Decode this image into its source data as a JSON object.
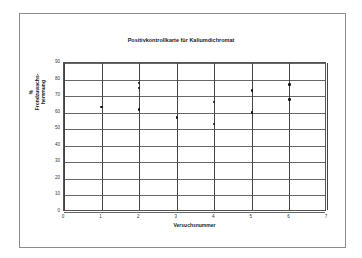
{
  "chart_data": {
    "type": "scatter",
    "title": "Positivkontrollkarte für Kaliumdichromat",
    "xlabel": "Versuchsnummer",
    "ylabel": "% Frondzuwachs-hemmung",
    "xlim": [
      0,
      7
    ],
    "ylim": [
      0,
      90
    ],
    "x_ticks": [
      0,
      1,
      2,
      3,
      4,
      5,
      6,
      7
    ],
    "y_ticks": [
      0,
      10,
      20,
      30,
      40,
      50,
      60,
      70,
      80,
      90
    ],
    "grid": true,
    "legend": null,
    "points": [
      {
        "x": 1,
        "y": 63.5
      },
      {
        "x": 2,
        "y": 78
      },
      {
        "x": 2,
        "y": 75
      },
      {
        "x": 2,
        "y": 62
      },
      {
        "x": 3,
        "y": 57
      },
      {
        "x": 4,
        "y": 66.5
      },
      {
        "x": 4,
        "y": 53
      },
      {
        "x": 5,
        "y": 73.5
      },
      {
        "x": 5,
        "y": 60
      },
      {
        "x": 6,
        "y": 77
      },
      {
        "x": 6,
        "y": 68
      }
    ]
  }
}
